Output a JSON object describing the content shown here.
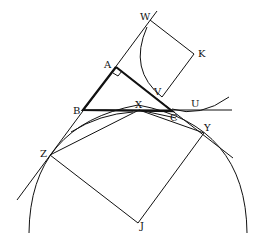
{
  "diagram": {
    "type": "geometry",
    "labels": {
      "W": "W",
      "K": "K",
      "A": "A",
      "V": "V",
      "B": "B",
      "X": "X",
      "U": "U",
      "C": "C",
      "Y": "Y",
      "Z": "Z",
      "J": "J"
    },
    "points": {
      "W": [
        150,
        20
      ],
      "K": [
        194,
        54
      ],
      "A": [
        116,
        67
      ],
      "V": [
        160,
        98
      ],
      "B": [
        83,
        110
      ],
      "X": [
        139,
        110
      ],
      "C": [
        172,
        111
      ],
      "U": [
        195,
        110
      ],
      "Y": [
        204,
        133
      ],
      "Z": [
        50,
        155
      ],
      "J": [
        138,
        223
      ]
    },
    "triangle": [
      "A",
      "B",
      "C"
    ],
    "right_angle_at": "A",
    "squares": [
      [
        "W",
        "K",
        "V"
      ],
      [
        "Z",
        "J",
        "Y"
      ]
    ],
    "stroke_color": "#111111",
    "background": "#ffffff"
  }
}
